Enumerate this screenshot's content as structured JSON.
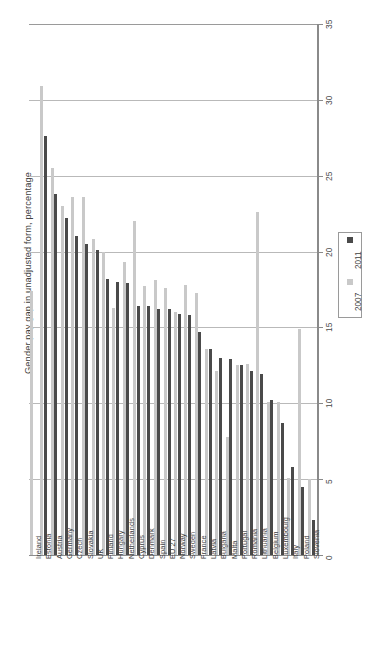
{
  "chart_data": {
    "type": "bar",
    "title": "",
    "xlabel": "",
    "ylabel": "Gender pay gap in unadjusted form, percentage",
    "ylim": [
      0,
      35
    ],
    "yticks": [
      0,
      5,
      10,
      15,
      20,
      25,
      30,
      35
    ],
    "grid": true,
    "orientation": "vertical-rotated",
    "legend_position": "right",
    "categories": [
      "Ireland",
      "Estonia",
      "Austria",
      "Germany",
      "Czech",
      "Slovakia",
      "UK",
      "Finland",
      "Hungary",
      "Netherlands",
      "Cyprus",
      "Denmark",
      "Spain",
      "EU 27",
      "Norway",
      "Sweden",
      "France",
      "Latvia",
      "Bulgaria",
      "Malta",
      "Portugal",
      "Romania",
      "Lithuania",
      "Belgium",
      "Luxembourg",
      "Italy",
      "Poland",
      "Slovenia"
    ],
    "series": [
      {
        "name": "2007",
        "color": "#c9c9c9",
        "values": [
          17.4,
          30.9,
          25.5,
          23.0,
          23.6,
          23.6,
          20.8,
          20.0,
          16.3,
          19.3,
          22.0,
          17.7,
          18.1,
          17.6,
          16.0,
          17.8,
          17.3,
          13.6,
          12.1,
          7.8,
          12.5,
          12.6,
          22.6,
          10.1,
          10.1,
          5.1,
          14.9,
          5.0
        ]
      },
      {
        "name": "2011",
        "color": "#4a4a4a",
        "values": [
          null,
          27.6,
          23.8,
          22.2,
          21.0,
          20.5,
          20.1,
          18.2,
          18.0,
          17.9,
          16.4,
          16.4,
          16.2,
          16.2,
          15.9,
          15.8,
          14.7,
          13.6,
          13.0,
          12.9,
          12.5,
          12.1,
          11.9,
          10.2,
          8.7,
          5.8,
          4.5,
          2.3
        ]
      }
    ],
    "legend": [
      {
        "label": "2007",
        "color": "#c9c9c9"
      },
      {
        "label": "2011",
        "color": "#4a4a4a"
      }
    ]
  },
  "colors": {
    "series_2007": "#c9c9c9",
    "series_2011": "#4a4a4a",
    "gridline": "#b9b9b9",
    "axis": "#8a8a8a",
    "text": "#3f3f3f",
    "background": "#ffffff"
  }
}
